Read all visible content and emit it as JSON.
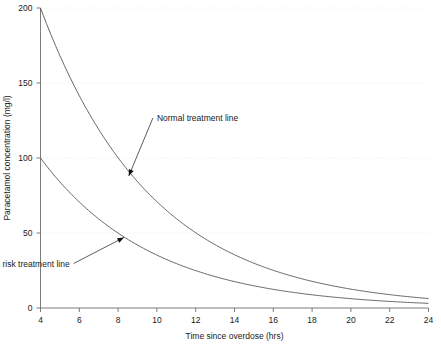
{
  "chart_data": {
    "type": "line",
    "title": "",
    "xlabel": "Time since overdose (hrs)",
    "ylabel": "Paracetamol concentration (mg/l)",
    "xlim": [
      4,
      24
    ],
    "ylim": [
      0,
      200
    ],
    "xticks": [
      4,
      6,
      8,
      10,
      12,
      14,
      16,
      18,
      20,
      22,
      24
    ],
    "xtick_labels": [
      "4",
      "6",
      "8",
      "10",
      "12",
      "14",
      "16",
      "18",
      "20",
      "22",
      "24"
    ],
    "yticks": [
      0,
      50,
      100,
      150,
      200
    ],
    "ytick_labels": [
      "0",
      "50",
      "100",
      "150",
      "200"
    ],
    "grid": "horizontal-dotted",
    "legend": "none",
    "x": [
      4,
      6,
      8,
      10,
      12,
      14,
      16,
      18,
      20,
      22,
      24
    ],
    "series": [
      {
        "name": "Normal treatment line",
        "values": [
          200,
          141.4,
          100,
          70.7,
          50,
          35.4,
          25,
          17.7,
          12.5,
          8.8,
          6.3
        ],
        "color": "#555555"
      },
      {
        "name": "High risk treatment line",
        "values": [
          100,
          70.7,
          50,
          35.4,
          25,
          17.7,
          12.5,
          8.8,
          6.3,
          4.4,
          3.1
        ],
        "color": "#555555"
      }
    ],
    "annotations": [
      {
        "label": "Normal treatment line",
        "text_x": 10.0,
        "text_y": 128,
        "point_x": 8.55,
        "point_y": 88
      },
      {
        "label": "High risk treatment line",
        "text_x": 5.5,
        "text_y": 31,
        "point_x": 8.3,
        "point_y": 47
      }
    ]
  }
}
